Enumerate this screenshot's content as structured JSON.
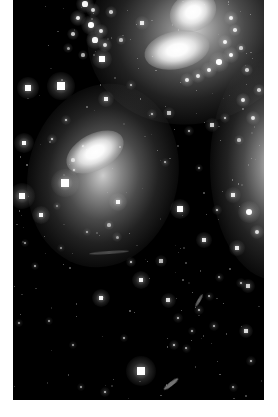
{
  "figure": {
    "caption": "",
    "plate": {
      "background_color": "#000000",
      "page_color": "#ffffff",
      "left_margin_px": 13,
      "right_margin_px": 14,
      "bottom_margin_px": 17,
      "width_px": 251,
      "height_px": 400
    }
  },
  "galaxies": [
    {
      "name": "upper-right-spiral-galaxy",
      "label": "Upper right distorted spiral",
      "center_x": 180,
      "center_y": 30,
      "halo_w": 215,
      "halo_h": 185,
      "rotation_deg": -18,
      "core_brightness": "#ffffff",
      "halo_color": "#9c9c9c"
    },
    {
      "name": "left-barred-spiral-galaxy",
      "label": "Left oval barred spiral",
      "center_x": 90,
      "center_y": 175,
      "halo_w": 150,
      "halo_h": 185,
      "rotation_deg": 12,
      "core_brightness": "#ffffff",
      "halo_color": "#8a8a8a"
    },
    {
      "name": "right-edge-galaxy",
      "label": "Right edge partially cropped galaxy",
      "center_x": 262,
      "center_y": 165,
      "halo_w": 130,
      "halo_h": 230,
      "rotation_deg": 0,
      "core_brightness": "#d8d8d8",
      "halo_color": "#7a7a7a"
    }
  ],
  "nuclei": [
    {
      "name": "nucleus-upper-north",
      "x": 180,
      "y": 12,
      "w": 48,
      "h": 38,
      "rot": -25,
      "peak": "#ffffff"
    },
    {
      "name": "nucleus-upper-south",
      "x": 164,
      "y": 50,
      "w": 66,
      "h": 38,
      "rot": -12,
      "peak": "#ffffff"
    },
    {
      "name": "nucleus-left-galaxy",
      "x": 82,
      "y": 152,
      "w": 62,
      "h": 36,
      "rot": -28,
      "peak": "#ffffff"
    }
  ],
  "star_field": {
    "description": "Foreground and cluster stars with square diffraction cores",
    "stars": [
      {
        "x": 15,
        "y": 88,
        "r": 3.6,
        "i": 1.0
      },
      {
        "x": 48,
        "y": 86,
        "r": 4.6,
        "i": 1.0
      },
      {
        "x": 9,
        "y": 196,
        "r": 4.4,
        "i": 1.0
      },
      {
        "x": 11,
        "y": 143,
        "r": 3.2,
        "i": 0.92
      },
      {
        "x": 28,
        "y": 215,
        "r": 3.0,
        "i": 0.9
      },
      {
        "x": 39,
        "y": 139,
        "r": 1.8,
        "i": 0.6
      },
      {
        "x": 52,
        "y": 183,
        "r": 4.8,
        "i": 1.0
      },
      {
        "x": 53,
        "y": 120,
        "r": 1.7,
        "i": 0.55
      },
      {
        "x": 61,
        "y": 170,
        "r": 1.6,
        "i": 0.5
      },
      {
        "x": 89,
        "y": 59,
        "r": 3.4,
        "i": 0.95
      },
      {
        "x": 93,
        "y": 99,
        "r": 2.8,
        "i": 0.85
      },
      {
        "x": 105,
        "y": 202,
        "r": 3.1,
        "i": 0.88
      },
      {
        "x": 118,
        "y": 85,
        "r": 1.6,
        "i": 0.5
      },
      {
        "x": 129,
        "y": 23,
        "r": 2.4,
        "i": 0.8
      },
      {
        "x": 139,
        "y": 114,
        "r": 1.6,
        "i": 0.5
      },
      {
        "x": 156,
        "y": 113,
        "r": 2.0,
        "i": 0.6
      },
      {
        "x": 167,
        "y": 209,
        "r": 3.4,
        "i": 0.95
      },
      {
        "x": 152,
        "y": 162,
        "r": 1.5,
        "i": 0.45
      },
      {
        "x": 176,
        "y": 131,
        "r": 1.6,
        "i": 0.5
      },
      {
        "x": 186,
        "y": 168,
        "r": 1.4,
        "i": 0.45
      },
      {
        "x": 191,
        "y": 240,
        "r": 2.6,
        "i": 0.82
      },
      {
        "x": 204,
        "y": 210,
        "r": 1.8,
        "i": 0.55
      },
      {
        "x": 220,
        "y": 195,
        "r": 2.6,
        "i": 0.8
      },
      {
        "x": 228,
        "y": 283,
        "r": 1.7,
        "i": 0.5
      },
      {
        "x": 206,
        "y": 277,
        "r": 1.5,
        "i": 0.45
      },
      {
        "x": 118,
        "y": 262,
        "r": 1.8,
        "i": 0.55
      },
      {
        "x": 128,
        "y": 280,
        "r": 3.0,
        "i": 0.88
      },
      {
        "x": 148,
        "y": 261,
        "r": 2.0,
        "i": 0.6
      },
      {
        "x": 88,
        "y": 298,
        "r": 3.0,
        "i": 0.9
      },
      {
        "x": 128,
        "y": 371,
        "r": 5.0,
        "i": 1.0
      },
      {
        "x": 155,
        "y": 300,
        "r": 2.5,
        "i": 0.78
      },
      {
        "x": 165,
        "y": 318,
        "r": 1.6,
        "i": 0.5
      },
      {
        "x": 161,
        "y": 345,
        "r": 1.8,
        "i": 0.55
      },
      {
        "x": 186,
        "y": 310,
        "r": 1.7,
        "i": 0.5
      },
      {
        "x": 179,
        "y": 331,
        "r": 1.4,
        "i": 0.45
      },
      {
        "x": 173,
        "y": 348,
        "r": 1.5,
        "i": 0.45
      },
      {
        "x": 196,
        "y": 296,
        "r": 1.5,
        "i": 0.45
      },
      {
        "x": 201,
        "y": 326,
        "r": 1.6,
        "i": 0.5
      },
      {
        "x": 224,
        "y": 248,
        "r": 2.6,
        "i": 0.82
      },
      {
        "x": 235,
        "y": 286,
        "r": 2.2,
        "i": 0.7
      },
      {
        "x": 233,
        "y": 331,
        "r": 2.4,
        "i": 0.75
      },
      {
        "x": 238,
        "y": 361,
        "r": 1.6,
        "i": 0.5
      },
      {
        "x": 220,
        "y": 387,
        "r": 1.5,
        "i": 0.45
      },
      {
        "x": 92,
        "y": 392,
        "r": 1.6,
        "i": 0.5
      },
      {
        "x": 68,
        "y": 387,
        "r": 1.3,
        "i": 0.4
      },
      {
        "x": 60,
        "y": 345,
        "r": 1.2,
        "i": 0.4
      },
      {
        "x": 36,
        "y": 321,
        "r": 1.3,
        "i": 0.4
      },
      {
        "x": 22,
        "y": 266,
        "r": 1.4,
        "i": 0.45
      },
      {
        "x": 12,
        "y": 243,
        "r": 1.2,
        "i": 0.4
      },
      {
        "x": 6,
        "y": 323,
        "r": 1.2,
        "i": 0.4
      },
      {
        "x": 111,
        "y": 338,
        "r": 1.4,
        "i": 0.45
      },
      {
        "x": 48,
        "y": 248,
        "r": 1.2,
        "i": 0.35
      },
      {
        "x": 74,
        "y": 232,
        "r": 1.3,
        "i": 0.4
      },
      {
        "x": 199,
        "y": 125,
        "r": 2.2,
        "i": 0.7
      },
      {
        "x": 212,
        "y": 118,
        "r": 1.8,
        "i": 0.55
      }
    ]
  },
  "hii_knots": {
    "description": "Bright star-forming knots in the tidal arms",
    "upper_left_region": [
      {
        "x": 72,
        "y": 4,
        "r": 2.6,
        "i": 0.95
      },
      {
        "x": 80,
        "y": 10,
        "r": 2.0,
        "i": 0.8
      },
      {
        "x": 65,
        "y": 18,
        "r": 2.4,
        "i": 0.9
      },
      {
        "x": 78,
        "y": 25,
        "r": 2.8,
        "i": 1.0
      },
      {
        "x": 88,
        "y": 31,
        "r": 2.2,
        "i": 0.85
      },
      {
        "x": 82,
        "y": 40,
        "r": 2.6,
        "i": 0.95
      },
      {
        "x": 92,
        "y": 45,
        "r": 2.0,
        "i": 0.8
      },
      {
        "x": 60,
        "y": 34,
        "r": 1.8,
        "i": 0.7
      },
      {
        "x": 98,
        "y": 12,
        "r": 1.8,
        "i": 0.7
      },
      {
        "x": 108,
        "y": 40,
        "r": 1.6,
        "i": 0.6
      },
      {
        "x": 55,
        "y": 48,
        "r": 1.5,
        "i": 0.55
      },
      {
        "x": 70,
        "y": 55,
        "r": 1.6,
        "i": 0.6
      }
    ],
    "upper_right_arm": [
      {
        "x": 218,
        "y": 18,
        "r": 2.0,
        "i": 0.85
      },
      {
        "x": 222,
        "y": 30,
        "r": 1.8,
        "i": 0.8
      },
      {
        "x": 212,
        "y": 42,
        "r": 2.2,
        "i": 0.9
      },
      {
        "x": 218,
        "y": 55,
        "r": 2.4,
        "i": 0.95
      },
      {
        "x": 206,
        "y": 62,
        "r": 2.8,
        "i": 1.0
      },
      {
        "x": 196,
        "y": 70,
        "r": 2.4,
        "i": 0.9
      },
      {
        "x": 185,
        "y": 76,
        "r": 2.0,
        "i": 0.8
      },
      {
        "x": 174,
        "y": 80,
        "r": 2.2,
        "i": 0.85
      },
      {
        "x": 228,
        "y": 48,
        "r": 1.6,
        "i": 0.65
      },
      {
        "x": 234,
        "y": 70,
        "r": 1.8,
        "i": 0.7
      }
    ],
    "right_galaxy": [
      {
        "x": 236,
        "y": 212,
        "r": 3.2,
        "i": 1.0
      },
      {
        "x": 230,
        "y": 100,
        "r": 2.2,
        "i": 0.85
      },
      {
        "x": 240,
        "y": 118,
        "r": 2.0,
        "i": 0.8
      },
      {
        "x": 246,
        "y": 90,
        "r": 1.8,
        "i": 0.7
      },
      {
        "x": 226,
        "y": 140,
        "r": 1.6,
        "i": 0.6
      },
      {
        "x": 244,
        "y": 232,
        "r": 2.0,
        "i": 0.8
      }
    ],
    "left_galaxy": [
      {
        "x": 60,
        "y": 160,
        "r": 1.6,
        "i": 0.6
      },
      {
        "x": 70,
        "y": 146,
        "r": 1.4,
        "i": 0.5
      },
      {
        "x": 96,
        "y": 225,
        "r": 1.6,
        "i": 0.55
      },
      {
        "x": 104,
        "y": 237,
        "r": 1.5,
        "i": 0.5
      },
      {
        "x": 44,
        "y": 206,
        "r": 1.3,
        "i": 0.45
      }
    ]
  },
  "tidal_streaks": [
    {
      "name": "lower-streak",
      "x": 158,
      "y": 384,
      "w": 18,
      "h": 4,
      "rot": -38,
      "opacity": 0.45
    },
    {
      "name": "mid-chain-streak",
      "x": 186,
      "y": 300,
      "w": 14,
      "h": 3,
      "rot": -60,
      "opacity": 0.4
    },
    {
      "name": "top-faint-streak",
      "x": 96,
      "y": 252,
      "w": 40,
      "h": 3,
      "rot": -4,
      "opacity": 0.22
    }
  ]
}
